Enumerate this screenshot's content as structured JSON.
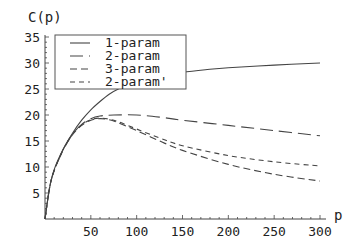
{
  "chart_data": {
    "type": "line",
    "title": "",
    "xlabel": "p",
    "ylabel": "C(p)",
    "xlim": [
      0,
      300
    ],
    "ylim": [
      0,
      35
    ],
    "xticks": [
      50,
      100,
      150,
      200,
      250,
      300
    ],
    "yticks": [
      5,
      10,
      15,
      20,
      25,
      30,
      35
    ],
    "grid": false,
    "legend_position": "upper-left",
    "series": [
      {
        "name": "1-param",
        "dash": "solid",
        "x": [
          0,
          5,
          10,
          20,
          30,
          40,
          50,
          60,
          70,
          80,
          100,
          125,
          150,
          175,
          200,
          250,
          300
        ],
        "y": [
          0,
          6,
          9.5,
          13.5,
          16.5,
          19,
          21,
          22.6,
          24,
          25,
          26.5,
          27.5,
          28.2,
          28.7,
          29.1,
          29.6,
          30
        ]
      },
      {
        "name": "2-param",
        "dash": "long",
        "x": [
          0,
          5,
          10,
          20,
          30,
          40,
          50,
          60,
          75,
          100,
          125,
          150,
          200,
          250,
          300
        ],
        "y": [
          0,
          6,
          9.3,
          13.3,
          16.3,
          18.2,
          19.3,
          19.8,
          20,
          20,
          19.6,
          19,
          18,
          17,
          16
        ]
      },
      {
        "name": "3-param",
        "dash": "medium",
        "x": [
          0,
          5,
          10,
          20,
          30,
          40,
          50,
          60,
          70,
          80,
          100,
          125,
          150,
          200,
          250,
          300
        ],
        "y": [
          0,
          6,
          9.3,
          13.4,
          16.2,
          18,
          19,
          19.3,
          19.1,
          18.5,
          17,
          15,
          13.2,
          10.5,
          8.6,
          7.3
        ]
      },
      {
        "name": "2-param'",
        "dash": "short",
        "x": [
          0,
          5,
          10,
          20,
          30,
          40,
          50,
          60,
          70,
          80,
          100,
          125,
          150,
          200,
          250,
          300
        ],
        "y": [
          0,
          6,
          9.3,
          13.4,
          16.3,
          18.1,
          19.1,
          19.4,
          19.2,
          18.7,
          17.3,
          15.6,
          14.1,
          12.2,
          11,
          10.2
        ]
      }
    ]
  },
  "legend": {
    "items": [
      "1-param",
      "2-param",
      "3-param",
      "2-param'"
    ]
  }
}
